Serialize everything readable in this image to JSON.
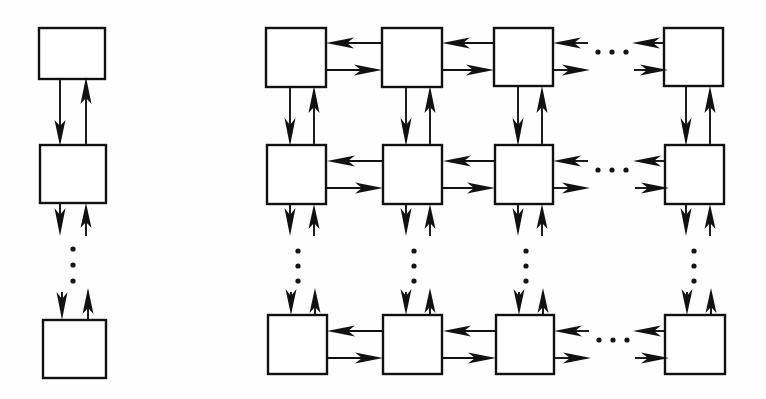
{
  "figure": {
    "title": "",
    "background_color": "#ffffff",
    "line_color": "#111111",
    "box_fill_color": "#ffffff",
    "width": 766,
    "height": 399
  },
  "diagram_data": {
    "type": "diagram",
    "description": "Two schematic node-interconnection topologies drawn with empty square blocks joined by paired directed arrows: a one-dimensional (linear array) chain on the left and a two-dimensional (mesh / grid) array on the right.",
    "panels": [
      {
        "id": "left-panel",
        "name": "linear-array",
        "label": "",
        "topology": "1-D chain",
        "columns": 1,
        "visible_rows": 3,
        "nodes": [
          {
            "id": "L-r1",
            "row": 1,
            "col": 1,
            "label": "",
            "x": 39,
            "y": 28,
            "w": 66,
            "h": 51
          },
          {
            "id": "L-r2",
            "row": 2,
            "col": 1,
            "label": "",
            "x": 40,
            "y": 145,
            "w": 66,
            "h": 58
          },
          {
            "id": "L-r3",
            "row": 3,
            "col": 1,
            "label": "",
            "x": 43,
            "y": 320,
            "w": 63,
            "h": 58
          }
        ],
        "vertical_ellipsis": [
          {
            "x": 73,
            "y_start": 248,
            "y_end": 281,
            "dots": 3
          }
        ],
        "edges": [
          {
            "from": "L-r1",
            "to": "L-r2",
            "direction": "down",
            "kind": "full"
          },
          {
            "from": "L-r2",
            "to": "L-r1",
            "direction": "up",
            "kind": "full"
          },
          {
            "from": "L-r2",
            "to": "continuation",
            "direction": "down",
            "kind": "stub"
          },
          {
            "from": "continuation",
            "to": "L-r2",
            "direction": "up",
            "kind": "stub"
          },
          {
            "from": "continuation",
            "to": "L-r3",
            "direction": "down",
            "kind": "stub"
          },
          {
            "from": "L-r3",
            "to": "continuation",
            "direction": "up",
            "kind": "stub"
          }
        ]
      },
      {
        "id": "right-panel",
        "name": "mesh-array",
        "label": "",
        "topology": "2-D mesh",
        "columns": 4,
        "visible_rows": 3,
        "column_ellipsis_after_column": 3,
        "nodes": [
          {
            "id": "R-r1c1",
            "row": 1,
            "col": 1,
            "label": "",
            "x": 266,
            "y": 28,
            "w": 60,
            "h": 59
          },
          {
            "id": "R-r1c2",
            "row": 1,
            "col": 2,
            "label": "",
            "x": 382,
            "y": 28,
            "w": 60,
            "h": 59
          },
          {
            "id": "R-r1c3",
            "row": 1,
            "col": 3,
            "label": "",
            "x": 494,
            "y": 28,
            "w": 59,
            "h": 58
          },
          {
            "id": "R-r1c4",
            "row": 1,
            "col": 4,
            "label": "",
            "x": 664,
            "y": 28,
            "w": 59,
            "h": 58
          },
          {
            "id": "R-r2c1",
            "row": 2,
            "col": 1,
            "label": "",
            "x": 267,
            "y": 145,
            "w": 59,
            "h": 59
          },
          {
            "id": "R-r2c2",
            "row": 2,
            "col": 2,
            "label": "",
            "x": 383,
            "y": 145,
            "w": 59,
            "h": 59
          },
          {
            "id": "R-r2c3",
            "row": 2,
            "col": 3,
            "label": "",
            "x": 495,
            "y": 145,
            "w": 58,
            "h": 59
          },
          {
            "id": "R-r2c4",
            "row": 2,
            "col": 4,
            "label": "",
            "x": 665,
            "y": 145,
            "w": 59,
            "h": 59
          },
          {
            "id": "R-r3c1",
            "row": 3,
            "col": 1,
            "label": "",
            "x": 268,
            "y": 315,
            "w": 59,
            "h": 59
          },
          {
            "id": "R-r3c2",
            "row": 3,
            "col": 2,
            "label": "",
            "x": 383,
            "y": 315,
            "w": 59,
            "h": 59
          },
          {
            "id": "R-r3c3",
            "row": 3,
            "col": 3,
            "label": "",
            "x": 496,
            "y": 315,
            "w": 58,
            "h": 59
          },
          {
            "id": "R-r3c4",
            "row": 3,
            "col": 4,
            "label": "",
            "x": 665,
            "y": 315,
            "w": 60,
            "h": 59
          }
        ],
        "horizontal_ellipsis": [
          {
            "row": 1,
            "x_start": 596,
            "x_end": 626,
            "y": 52,
            "dots": 3
          },
          {
            "row": 2,
            "x_start": 596,
            "x_end": 626,
            "y": 170,
            "dots": 3
          },
          {
            "row": 3,
            "x_start": 597,
            "x_end": 627,
            "y": 340,
            "dots": 3
          }
        ],
        "vertical_ellipsis": [
          {
            "col": 1,
            "x": 298,
            "y_start": 250,
            "y_end": 282,
            "dots": 3
          },
          {
            "col": 2,
            "x": 414,
            "y_start": 250,
            "y_end": 282,
            "dots": 3
          },
          {
            "col": 3,
            "x": 526,
            "y_start": 250,
            "y_end": 282,
            "dots": 3
          },
          {
            "col": 4,
            "x": 694,
            "y_start": 250,
            "y_end": 282,
            "dots": 3
          }
        ],
        "edge_pattern": {
          "horizontal": "each adjacent column pair is joined by two anti-parallel arrows: an upper arrow pointing left and a lower arrow pointing right",
          "vertical": "each adjacent row pair is joined by two anti-parallel arrows: a left arrow pointing down and a right arrow pointing up",
          "boundary": "nodes on the array edges carry short stub arrows indicating continuation of the mesh"
        }
      }
    ]
  }
}
